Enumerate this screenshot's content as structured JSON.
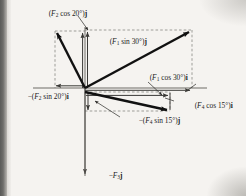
{
  "figure": {
    "type": "vector-force-diagram",
    "origin": {
      "x": 85,
      "y": 88
    },
    "axes": {
      "x_axis": {
        "x1": 33,
        "y1": 88,
        "x2": 207,
        "y2": 88
      },
      "y_axis": {
        "x1": 85,
        "y1": 27,
        "x2": 85,
        "y2": 178
      }
    },
    "vectors": [
      {
        "name": "F1",
        "from": [
          85,
          88
        ],
        "to": [
          192,
          30
        ],
        "quadrant": "upper-right"
      },
      {
        "name": "F2",
        "from": [
          85,
          88
        ],
        "to": [
          55,
          31
        ],
        "quadrant": "upper-left"
      },
      {
        "name": "F3",
        "from": [
          85,
          88
        ],
        "to": [
          85,
          175
        ],
        "quadrant": "down"
      },
      {
        "name": "F4",
        "from": [
          85,
          92
        ],
        "to": [
          170,
          111
        ],
        "quadrant": "lower-right"
      }
    ],
    "labels": {
      "f2_cos20_j": "(F₂ cos 20°)j",
      "f1_sin30_j": "(F₁ sin 30°)j",
      "f1_cos30_i": "(F₁ cos 30°)i",
      "neg_f2_sin20_i": "−(F₂ sin 20°)i",
      "f4_cos15_i": "(F₄ cos 15°)i",
      "neg_f4_sin15_j": "−(F₄ sin 15°)j",
      "neg_f3_j": "−F₃j"
    },
    "label_parts": {
      "f2_cos20_j": {
        "pre": "(",
        "sym": "F",
        "sub": "2",
        "mid": " cos 20°)",
        "unit": "j"
      },
      "f1_sin30_j": {
        "pre": "(",
        "sym": "F",
        "sub": "1",
        "mid": " sin 30°)",
        "unit": "j"
      },
      "f1_cos30_i": {
        "pre": "(",
        "sym": "F",
        "sub": "1",
        "mid": " cos 30°)",
        "unit": "i"
      },
      "neg_f2_sin20_i": {
        "pre": "−(",
        "sym": "F",
        "sub": "2",
        "mid": " sin 20°)",
        "unit": "i"
      },
      "f4_cos15_i": {
        "pre": "(",
        "sym": "F",
        "sub": "4",
        "mid": " cos 15°)",
        "unit": "i"
      },
      "neg_f4_sin15_j": {
        "pre": "−(",
        "sym": "F",
        "sub": "4",
        "mid": " sin 15°)",
        "unit": "j"
      },
      "neg_f3_j": {
        "pre": "−",
        "sym": "F",
        "sub": "3",
        "mid": "",
        "unit": "j"
      }
    },
    "colors": {
      "ink": "#1c1c1c",
      "vector": "#111111",
      "axis": "#55534f",
      "dashed": "#7a7874",
      "page": "#f5f3f0",
      "gutter": "#5a5a58"
    },
    "angles": {
      "F1": "30°",
      "F2": "20°",
      "F4": "15°"
    }
  }
}
